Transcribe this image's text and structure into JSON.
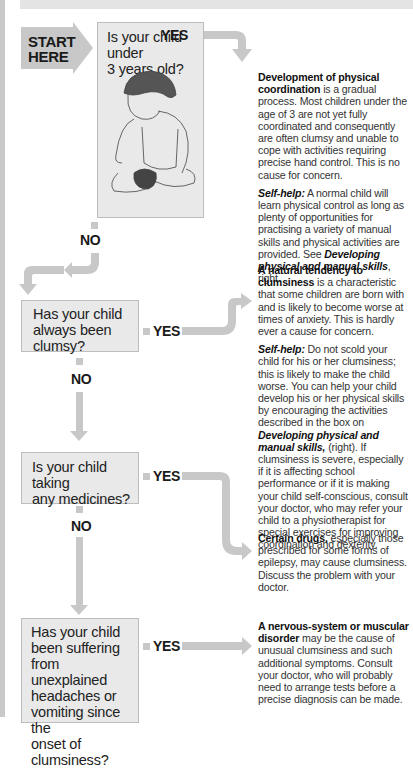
{
  "start": {
    "line1": "START",
    "line2": "HERE"
  },
  "labels": {
    "yes": "YES",
    "no": "NO"
  },
  "colors": {
    "arrow": "#c8c8c8",
    "box_fill": "#e9e9e9",
    "box_border": "#bdbdbd",
    "side_bar": "#c9c9c9"
  },
  "questions": [
    {
      "text_lines": [
        "Is your child under",
        "3 years old?"
      ],
      "illustration": "child-sitting-putting-on-shoe"
    },
    {
      "text_lines": [
        "Has your child",
        "always been",
        "clumsy?"
      ]
    },
    {
      "text_lines": [
        "Is your child taking",
        "any medicines?"
      ]
    },
    {
      "text_lines": [
        "Has your child",
        "been suffering",
        "from unexplained",
        "headaches or",
        "vomiting since the",
        "onset of",
        "clumsiness?"
      ]
    }
  ],
  "answers": [
    {
      "heading": "Development of physical coordination",
      "body": " is a gradual process. Most children under the age of 3 are not yet fully coordinated and consequently are often clumsy and unable to cope with activities requiring precise hand control. This is no cause for concern.",
      "selfhelp_label": "Self-help:",
      "selfhelp_body": " A normal child will learn physical control as long as plenty of opportunities for practising a variety of manual skills and physical activities are provided. See ",
      "selfhelp_link": "Developing physical and manual skills",
      "selfhelp_tail": ", right."
    },
    {
      "heading": "A natural tendency to clumsiness",
      "body": " is a characteristic that some children are born with and is likely to become worse at times of anxiety. This is hardly ever a cause for concern.",
      "selfhelp_label": "Self-help:",
      "selfhelp_body": " Do not scold your child for his or her clumsiness; this is likely to make the child worse. You can help your child develop his or her physical skills by encouraging the activities described in the box on ",
      "selfhelp_link": "Developing physical and manual skills,",
      "selfhelp_tail": " (right). If clumsiness is severe, especially if it is affecting school performance or if it is making your child self-conscious, consult your doctor, who may refer your child to a physiotherapist for special exercises for improving coordination and dexterity."
    },
    {
      "heading": "Certain drugs,",
      "body": " especially those prescribed for some forms of epilepsy, may cause clumsiness. Discuss the problem with your doctor."
    },
    {
      "heading": "A nervous-system or muscular disorder",
      "body": " may be the cause of unusual clumsiness and such additional symptoms. Consult your doctor, who will probably need to arrange tests before a precise diagnosis can be made."
    }
  ]
}
